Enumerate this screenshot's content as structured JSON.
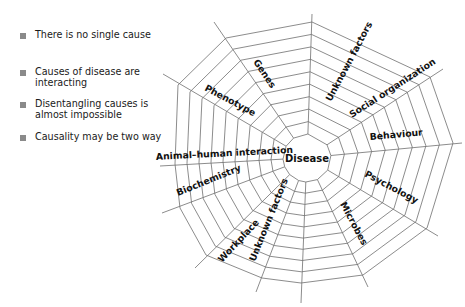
{
  "bullets": [
    {
      "text": "There is no single cause"
    },
    {
      "text": "Causes of disease are interacting"
    },
    {
      "text": "Disentangling causes is almost impossible"
    },
    {
      "text": "Causality may be two way"
    }
  ],
  "web": {
    "center_label": "Disease",
    "spokes": [
      {
        "label": "Unknown factors"
      },
      {
        "label": "Social organization"
      },
      {
        "label": "Behaviour"
      },
      {
        "label": "Psychology"
      },
      {
        "label": "Microbes"
      },
      {
        "label": "Unknown factors"
      },
      {
        "label": "Workplace"
      },
      {
        "label": "Biochemistry"
      },
      {
        "label": "Animal–human interaction"
      },
      {
        "label": "Phenotype"
      },
      {
        "label": "Genes"
      }
    ],
    "line_color": "#6e6e6e",
    "bullet_color": "#8a8a8a"
  }
}
